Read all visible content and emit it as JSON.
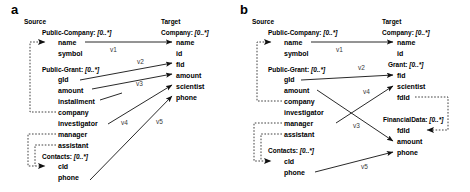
{
  "figure": {
    "type": "schema-mapping-diagram",
    "panels": [
      {
        "letter": "a",
        "source_header": "Source",
        "target_header": "Target",
        "source_classes": [
          {
            "name": "Public-Company",
            "cardinality": "[0..*]",
            "fields": [
              "name",
              "symbol"
            ]
          },
          {
            "name": "Public-Grant",
            "cardinality": "[0..*]",
            "fields": [
              "gId",
              "amount",
              "installment",
              "company",
              "investigator",
              "manager",
              "assistant"
            ]
          },
          {
            "name": "Contacts",
            "cardinality": "[0..*]",
            "fields": [
              "cId",
              "phone"
            ]
          }
        ],
        "target_classes": [
          {
            "name": "Company",
            "cardinality": "[0..*]",
            "fields": [
              "name",
              "id",
              "fid",
              "amount",
              "scientist",
              "phone"
            ]
          }
        ],
        "mappings": [
          {
            "label": "v1",
            "from": "Public-Company.name",
            "to": "Company.name"
          },
          {
            "label": "v2",
            "from": "Public-Grant.gId",
            "to": "Company.fid"
          },
          {
            "label": "v3",
            "from": "Public-Grant.amount",
            "to": "Company.amount"
          },
          {
            "label": "v4",
            "from": "Public-Grant.investigator",
            "to": "Company.scientist"
          },
          {
            "label": "v5",
            "from": "Contacts.phone",
            "to": "Company.phone"
          }
        ],
        "reference_links": [
          {
            "from": "Public-Grant.company",
            "to": "Public-Company.name"
          },
          {
            "from": "Public-Grant.manager",
            "to": "Contacts.cId"
          },
          {
            "from": "Public-Grant.assistant",
            "to": "Contacts.cId"
          }
        ]
      },
      {
        "letter": "b",
        "source_header": "Source",
        "target_header": "Target",
        "source_classes": [
          {
            "name": "Public-Company",
            "cardinality": "[0..*]",
            "fields": [
              "name",
              "symbol"
            ]
          },
          {
            "name": "Public-Grant",
            "cardinality": "[0..*]",
            "fields": [
              "gId",
              "amount",
              "company",
              "investigator",
              "manager",
              "assistant"
            ]
          },
          {
            "name": "Contacts",
            "cardinality": "[0..*]",
            "fields": [
              "cId",
              "phone"
            ]
          }
        ],
        "target_classes": [
          {
            "name": "Company",
            "cardinality": "[0..*]",
            "fields": [
              "name",
              "id"
            ]
          },
          {
            "name": "Grant",
            "cardinality": "[0..*]",
            "fields": [
              "fid",
              "scientist",
              "fdId"
            ]
          },
          {
            "name": "FinancialData",
            "cardinality": "[0..*]",
            "fields": [
              "fdId",
              "amount",
              "phone"
            ]
          }
        ],
        "mappings": [
          {
            "label": "v1",
            "from": "Public-Company.name",
            "to": "Company.name"
          },
          {
            "label": "v2",
            "from": "Public-Grant.gId",
            "to": "Grant.fid"
          },
          {
            "label": "v3",
            "from": "Public-Grant.amount",
            "to": "FinancialData.amount"
          },
          {
            "label": "v4",
            "from": "Public-Grant.investigator",
            "to": "Grant.scientist"
          },
          {
            "label": "v5",
            "from": "Contacts.phone",
            "to": "FinancialData.phone"
          }
        ],
        "reference_links": [
          {
            "from": "Public-Grant.company",
            "to": "Public-Company.name"
          },
          {
            "from": "Public-Grant.manager",
            "to": "Contacts.cId"
          },
          {
            "from": "Public-Grant.assistant",
            "to": "Contacts.cId"
          },
          {
            "from": "Grant.fdId",
            "to": "FinancialData.fdId"
          }
        ]
      }
    ]
  }
}
